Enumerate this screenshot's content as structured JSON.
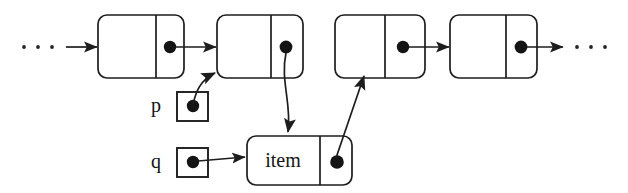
{
  "diagram": {
    "type": "linked-list-pointer-diagram",
    "background_color": "#ffffff",
    "ink_color": "#1d1d1d",
    "dot_color": "#141414",
    "leading_ellipsis": "· · ·",
    "trailing_ellipsis": "· · ·",
    "nodes": [
      {
        "id": "node-1",
        "label": "",
        "has_pointer_dot": true
      },
      {
        "id": "node-2",
        "label": "",
        "has_pointer_dot": true
      },
      {
        "id": "node-3",
        "label": "",
        "has_pointer_dot": true
      },
      {
        "id": "node-4",
        "label": "",
        "has_pointer_dot": true
      },
      {
        "id": "node-item",
        "label": "item",
        "has_pointer_dot": true
      }
    ],
    "variables": [
      {
        "id": "var-p",
        "label": "p",
        "has_pointer_dot": true
      },
      {
        "id": "var-q",
        "label": "q",
        "has_pointer_dot": true
      }
    ],
    "arrows": [
      {
        "id": "arrow-ellipsis-to-node1",
        "from": "leading-ellipsis",
        "to": "node-1",
        "style": "straight"
      },
      {
        "id": "arrow-node1-to-node2",
        "from": "node-1",
        "to": "node-2",
        "style": "straight"
      },
      {
        "id": "arrow-node3-to-node4",
        "from": "node-3",
        "to": "node-4",
        "style": "straight"
      },
      {
        "id": "arrow-node4-to-ellipsis",
        "from": "node-4",
        "to": "trailing-ellipsis",
        "style": "straight"
      },
      {
        "id": "arrow-p-to-node2",
        "from": "var-p",
        "to": "node-2",
        "style": "curved"
      },
      {
        "id": "arrow-q-to-item",
        "from": "var-q",
        "to": "node-item",
        "style": "straight"
      },
      {
        "id": "arrow-node2-to-item",
        "from": "node-2",
        "to": "node-item",
        "style": "curved"
      },
      {
        "id": "arrow-item-to-node3",
        "from": "node-item",
        "to": "node-3",
        "style": "straight"
      }
    ]
  }
}
